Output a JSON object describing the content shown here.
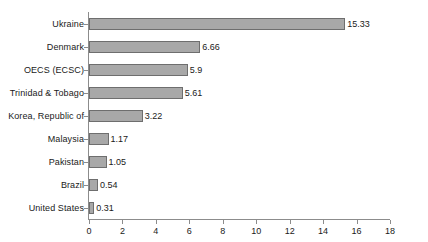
{
  "chart_data": {
    "type": "bar",
    "orientation": "horizontal",
    "title": "",
    "subtitle": "",
    "xlabel": "",
    "ylabel": "",
    "xlim": [
      0,
      18
    ],
    "ylim": null,
    "grid": false,
    "legend": null,
    "x_ticks": [
      0,
      2,
      4,
      6,
      8,
      10,
      12,
      14,
      16,
      18
    ],
    "x_tick_labels": [
      "0",
      "2",
      "4",
      "6",
      "8",
      "10",
      "12",
      "14",
      "16",
      "18"
    ],
    "categories": [
      "Ukraine",
      "Denmark",
      "OECS (ECSC)",
      "Trinidad & Tobago",
      "Korea, Republic of",
      "Malaysia",
      "Pakistan",
      "Brazil",
      "United States"
    ],
    "values": [
      15.33,
      6.66,
      5.9,
      5.61,
      3.22,
      1.17,
      1.05,
      0.54,
      0.31
    ],
    "value_labels": [
      "15.33",
      "6.66",
      "5.9",
      "5.61",
      "3.22",
      "1.17",
      "1.05",
      "0.54",
      "0.31"
    ],
    "bar_color": "#a8a8a8",
    "bar_border_color": "#6e6e6e",
    "axis_color": "#8c8c8c",
    "text_color": "#1a1a1a",
    "background_color": "#ffffff"
  }
}
